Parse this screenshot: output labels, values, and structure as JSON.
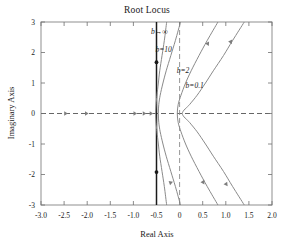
{
  "chart_data": {
    "type": "line",
    "title": "Root Locus",
    "xlabel": "Real Axis",
    "ylabel": "Imaginary Axis",
    "xlim": [
      -3.0,
      2.0
    ],
    "ylim": [
      -3,
      3
    ],
    "xticks": [
      "-3.0",
      "-2.5",
      "-2.0",
      "-1.5",
      "-1.0",
      "-0.5",
      "0",
      "0.5",
      "1.0",
      "1.5",
      "2.0"
    ],
    "xtick_values": [
      -3.0,
      -2.5,
      -2.0,
      -1.5,
      -1.0,
      -0.5,
      0,
      0.5,
      1.0,
      1.5,
      2.0
    ],
    "yticks": [
      "-3",
      "-2",
      "-1",
      "0",
      "1",
      "2",
      "3"
    ],
    "ytick_values": [
      -3,
      -2,
      -1,
      0,
      1,
      2,
      3
    ],
    "grid": false,
    "legend": "inline-annotations",
    "annotations": [
      {
        "text": "b→∞",
        "x": -0.62,
        "y": 2.62
      },
      {
        "text": "b=10",
        "x": -0.52,
        "y": 2.03
      },
      {
        "text": "b=2",
        "x": -0.06,
        "y": 1.33
      },
      {
        "text": "b=0.1",
        "x": 0.13,
        "y": 0.82
      }
    ],
    "series": [
      {
        "name": "b→∞",
        "color": "#1a1a1a",
        "style": "solid-vertical-asymptote",
        "points": [
          [
            -0.5,
            -3
          ],
          [
            -0.5,
            3
          ]
        ],
        "markers": [
          [
            -0.5,
            1.68
          ],
          [
            -0.5,
            -1.92
          ]
        ]
      },
      {
        "name": "b=10",
        "color": "#8a8a8a",
        "style": "solid",
        "points": [
          [
            -0.28,
            3
          ],
          [
            -0.33,
            2.4
          ],
          [
            -0.38,
            1.9
          ],
          [
            -0.43,
            1.4
          ],
          [
            -0.46,
            1.0
          ],
          [
            -0.49,
            0.6
          ],
          [
            -0.51,
            0.3
          ],
          [
            -0.52,
            0
          ],
          [
            -0.51,
            -0.3
          ],
          [
            -0.49,
            -0.6
          ],
          [
            -0.46,
            -1.0
          ],
          [
            -0.43,
            -1.4
          ],
          [
            -0.38,
            -1.9
          ],
          [
            -0.33,
            -2.4
          ],
          [
            -0.28,
            -3
          ]
        ]
      },
      {
        "name": "b=2",
        "color": "#8a8a8a",
        "style": "solid",
        "points": [
          [
            0.02,
            3
          ],
          [
            -0.09,
            2.4
          ],
          [
            -0.19,
            1.9
          ],
          [
            -0.29,
            1.4
          ],
          [
            -0.36,
            1.0
          ],
          [
            -0.42,
            0.6
          ],
          [
            -0.45,
            0.3
          ],
          [
            -0.46,
            0
          ],
          [
            -0.45,
            -0.3
          ],
          [
            -0.42,
            -0.6
          ],
          [
            -0.36,
            -1.0
          ],
          [
            -0.29,
            -1.4
          ],
          [
            -0.19,
            -1.9
          ],
          [
            -0.09,
            -2.4
          ],
          [
            0.02,
            -3
          ]
        ]
      },
      {
        "name": "b=0.1-inner",
        "color": "#8a8a8a",
        "style": "solid",
        "points": [
          [
            0.83,
            3
          ],
          [
            0.6,
            2.4
          ],
          [
            0.42,
            1.9
          ],
          [
            0.25,
            1.4
          ],
          [
            0.13,
            1.0
          ],
          [
            0.03,
            0.6
          ],
          [
            -0.03,
            0.3
          ],
          [
            -0.05,
            0
          ],
          [
            -0.03,
            -0.3
          ],
          [
            0.03,
            -0.6
          ],
          [
            0.13,
            -1.0
          ],
          [
            0.25,
            -1.4
          ],
          [
            0.42,
            -1.9
          ],
          [
            0.6,
            -2.4
          ],
          [
            0.83,
            -3
          ]
        ]
      },
      {
        "name": "b=0.1-outer",
        "color": "#8a8a8a",
        "style": "solid",
        "points": [
          [
            1.4,
            3
          ],
          [
            1.15,
            2.4
          ],
          [
            0.95,
            1.9
          ],
          [
            0.73,
            1.4
          ],
          [
            0.56,
            1.0
          ],
          [
            0.38,
            0.6
          ],
          [
            0.22,
            0.3
          ],
          [
            0.06,
            0
          ],
          [
            0.22,
            -0.3
          ],
          [
            0.38,
            -0.6
          ],
          [
            0.56,
            -1.0
          ],
          [
            0.73,
            -1.4
          ],
          [
            0.95,
            -1.9
          ],
          [
            1.15,
            -2.4
          ],
          [
            1.4,
            -3
          ]
        ]
      }
    ],
    "reference_lines": [
      {
        "name": "real-axis",
        "orientation": "horizontal",
        "value": 0,
        "style": "dashed",
        "color": "#555555"
      },
      {
        "name": "imaginary-axis",
        "orientation": "vertical",
        "value": 0,
        "style": "dashed",
        "color": "#8a8a8a"
      }
    ],
    "real_axis_arrows": [
      -2.45,
      -2.0,
      -0.95,
      -0.75,
      -0.6
    ]
  }
}
